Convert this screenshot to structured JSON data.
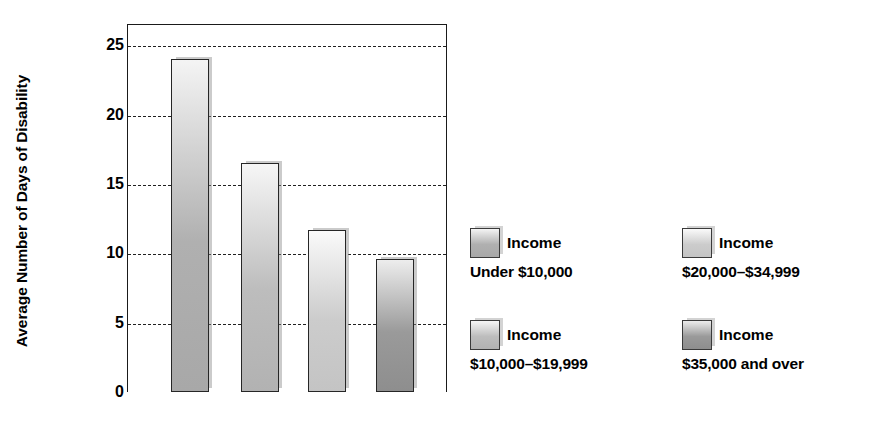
{
  "chart_data": {
    "type": "bar",
    "title": "",
    "xlabel": "",
    "ylabel": "Average Number of Days of Disability",
    "ylim": [
      0,
      25
    ],
    "yticks": [
      0,
      5,
      10,
      15,
      20,
      25
    ],
    "ytick_labels": [
      "0",
      "5",
      "10",
      "15",
      "20",
      "25"
    ],
    "gridlines_at": [
      5,
      10,
      15,
      20,
      25
    ],
    "grid": true,
    "legend_position": "right",
    "categories": [
      "Income Under $10,000",
      "Income $10,000–$19,999",
      "Income $20,000–$34,999",
      "Income $35,000 and over"
    ],
    "values": [
      24.0,
      16.5,
      11.7,
      9.6
    ],
    "bar_colors": [
      "#b0b0b0",
      "#bdbdbd",
      "#cccccc",
      "#9a9a9a"
    ],
    "bar_gradient_top": [
      "#f4f4f4",
      "#f6f6f6",
      "#fafafa",
      "#ededed"
    ],
    "bar_gradient_bottom": [
      "#a8a8a8",
      "#b2b2b2",
      "#c4c4c4",
      "#8e8e8e"
    ],
    "bar_border_color": "#262626",
    "axis_color": "#1a1a1a"
  },
  "y_axis": {
    "title": "Average Number of Days of Disability",
    "ticks": [
      {
        "label": "25",
        "value": 25
      },
      {
        "label": "20",
        "value": 20
      },
      {
        "label": "15",
        "value": 15
      },
      {
        "label": "10",
        "value": 10
      },
      {
        "label": "5",
        "value": 5
      },
      {
        "label": "0",
        "value": 0
      }
    ]
  },
  "legend": {
    "items": [
      {
        "line1": "Income",
        "line2": "Under $10,000"
      },
      {
        "line1": "Income",
        "line2": "$20,000–$34,999"
      },
      {
        "line1": "Income",
        "line2": "$10,000–$19,999"
      },
      {
        "line1": "Income",
        "line2": "$35,000 and over"
      }
    ]
  }
}
